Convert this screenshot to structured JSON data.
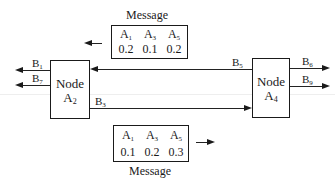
{
  "diagram": {
    "nodes": [
      {
        "id": "A2",
        "title": "Node",
        "name_base": "A",
        "name_sub": "2"
      },
      {
        "id": "A4",
        "title": "Node",
        "name_base": "A",
        "name_sub": "4"
      }
    ],
    "links": {
      "left_out_top": {
        "base": "B",
        "sub": "1",
        "direction": "left",
        "from": "A2"
      },
      "left_out_bottom": {
        "base": "B",
        "sub": "7",
        "direction": "left",
        "from": "A2"
      },
      "a4_to_a2": {
        "base": "B",
        "sub": "5",
        "direction": "left",
        "from": "A4",
        "to": "A2"
      },
      "a2_to_a4": {
        "base": "B",
        "sub": "3",
        "direction": "right",
        "from": "A2",
        "to": "A4"
      },
      "right_out_top": {
        "base": "B",
        "sub": "6",
        "direction": "right",
        "from": "A4"
      },
      "right_out_bottom": {
        "base": "B",
        "sub": "9",
        "direction": "right",
        "from": "A4"
      }
    },
    "messages": [
      {
        "position": "top",
        "label": "Message",
        "direction": "left",
        "headers": [
          {
            "base": "A",
            "sub": "1"
          },
          {
            "base": "A",
            "sub": "3"
          },
          {
            "base": "A",
            "sub": "5"
          }
        ],
        "values": [
          "0.2",
          "0.1",
          "0.2"
        ]
      },
      {
        "position": "bottom",
        "label": "Message",
        "direction": "right",
        "headers": [
          {
            "base": "A",
            "sub": "1"
          },
          {
            "base": "A",
            "sub": "3"
          },
          {
            "base": "A",
            "sub": "5"
          }
        ],
        "values": [
          "0.1",
          "0.2",
          "0.3"
        ]
      }
    ]
  }
}
